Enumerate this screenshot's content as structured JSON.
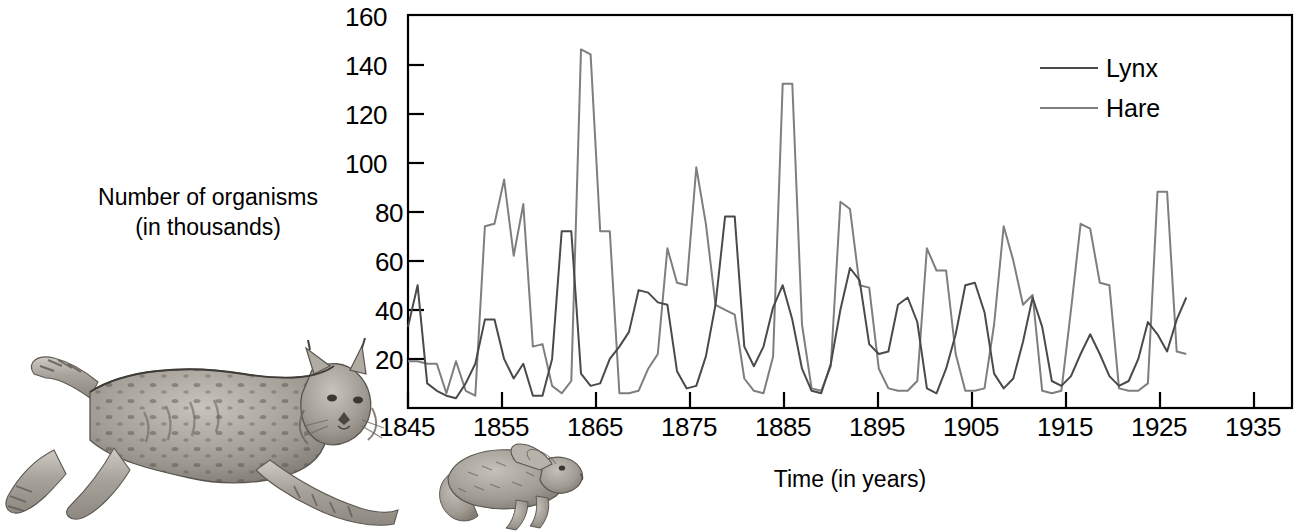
{
  "figure": {
    "title": "",
    "background_color": "#ffffff"
  },
  "axes": {
    "y_label_line1": "Number of organisms",
    "y_label_line2": "(in thousands)",
    "x_label": "Time (in years)",
    "y_ticks": [
      "20",
      "40",
      "60",
      "80",
      "100",
      "120",
      "140",
      "160"
    ],
    "x_ticks": [
      "1845",
      "1855",
      "1865",
      "1875",
      "1885",
      "1895",
      "1905",
      "1915",
      "1925",
      "1935"
    ]
  },
  "legend": {
    "items": [
      {
        "label": "Lynx",
        "color": "#4a4a4a"
      },
      {
        "label": "Hare",
        "color": "#7e7e7e"
      }
    ]
  },
  "illustrations": [
    {
      "name": "lynx-drawing",
      "caption": "Lynx"
    },
    {
      "name": "hare-drawing",
      "caption": "Snowshoe hare"
    }
  ],
  "chart_data": {
    "type": "line",
    "title": "",
    "subtitle": "",
    "xlabel": "Time (in years)",
    "ylabel": "Number of organisms (in thousands)",
    "xlim": [
      1845,
      1937
    ],
    "ylim": [
      0,
      160
    ],
    "y_ticks": [
      20,
      40,
      60,
      80,
      100,
      120,
      140,
      160
    ],
    "x_ticks": [
      1845,
      1855,
      1865,
      1875,
      1885,
      1895,
      1905,
      1915,
      1925,
      1935
    ],
    "grid": false,
    "legend_position": "top-right",
    "x": [
      1845,
      1846,
      1847,
      1848,
      1849,
      1850,
      1851,
      1852,
      1853,
      1854,
      1855,
      1856,
      1857,
      1858,
      1859,
      1860,
      1861,
      1862,
      1863,
      1864,
      1865,
      1866,
      1867,
      1868,
      1869,
      1870,
      1871,
      1872,
      1873,
      1874,
      1875,
      1876,
      1877,
      1878,
      1879,
      1880,
      1881,
      1882,
      1883,
      1884,
      1885,
      1886,
      1887,
      1888,
      1889,
      1890,
      1891,
      1892,
      1893,
      1894,
      1895,
      1896,
      1897,
      1898,
      1899,
      1900,
      1901,
      1902,
      1903,
      1904,
      1905,
      1906,
      1907,
      1908,
      1909,
      1910,
      1911,
      1912,
      1913,
      1914,
      1915,
      1916,
      1917,
      1918,
      1919,
      1920,
      1921,
      1922,
      1923,
      1924,
      1925,
      1926,
      1927,
      1928,
      1929,
      1930,
      1931,
      1932,
      1933,
      1934,
      1935,
      1936,
      1937
    ],
    "series": [
      {
        "name": "Hare",
        "color": "#7e7e7e",
        "values": [
          20,
          20,
          52,
          83,
          64,
          68,
          83,
          12,
          36,
          150,
          110,
          60,
          7,
          10,
          70,
          100,
          92,
          70,
          10,
          11,
          137,
          137,
          18,
          22,
          52,
          83,
          18,
          10,
          9,
          65,
          11,
          82,
          90,
          27,
          20,
          30,
          6,
          45,
          140,
          100,
          15,
          5,
          12,
          15,
          130,
          60,
          55,
          40,
          9,
          9,
          65,
          35,
          75,
          40,
          18,
          20,
          40,
          65,
          80,
          25,
          18,
          30,
          20,
          22,
          80,
          90,
          40,
          15,
          5,
          10,
          55,
          65,
          60,
          20,
          10,
          25,
          40,
          50,
          40,
          30,
          18,
          10,
          15,
          40,
          85,
          60,
          30,
          18,
          10,
          5,
          20,
          65,
          55
        ]
      },
      {
        "name": "Lynx",
        "color": "#4a4a4a",
        "values": [
          35,
          50,
          15,
          5,
          6,
          10,
          20,
          30,
          35,
          20,
          10,
          8,
          6,
          5,
          8,
          30,
          40,
          45,
          60,
          60,
          40,
          30,
          12,
          8,
          8,
          12,
          18,
          25,
          35,
          40,
          20,
          18,
          12,
          8,
          5,
          8,
          12,
          20,
          30,
          45,
          50,
          35,
          20,
          15,
          20,
          30,
          40,
          45,
          30,
          20,
          12,
          10,
          18,
          25,
          35,
          45,
          45,
          35,
          25,
          15,
          10,
          12,
          18,
          25,
          35,
          45,
          40,
          30,
          20,
          12,
          10,
          15,
          20,
          25,
          30,
          35,
          40,
          35,
          25,
          18,
          12,
          10,
          12,
          18,
          25,
          35,
          40,
          35,
          25,
          18,
          12,
          15,
          20
        ]
      }
    ],
    "hare_points": [
      {
        "year": 1845,
        "value": 19
      },
      {
        "year": 1846,
        "value": 19
      },
      {
        "year": 1847,
        "value": 18
      },
      {
        "year": 1848,
        "value": 18
      },
      {
        "year": 1849,
        "value": 6
      },
      {
        "year": 1850,
        "value": 19
      },
      {
        "year": 1851,
        "value": 7
      },
      {
        "year": 1852,
        "value": 5
      },
      {
        "year": 1853,
        "value": 74
      },
      {
        "year": 1854,
        "value": 75
      },
      {
        "year": 1855,
        "value": 93
      },
      {
        "year": 1856,
        "value": 62
      },
      {
        "year": 1857,
        "value": 83
      },
      {
        "year": 1858,
        "value": 25
      },
      {
        "year": 1859,
        "value": 26
      },
      {
        "year": 1860,
        "value": 9
      },
      {
        "year": 1861,
        "value": 6
      },
      {
        "year": 1862,
        "value": 11
      },
      {
        "year": 1863,
        "value": 146
      },
      {
        "year": 1864,
        "value": 144
      },
      {
        "year": 1865,
        "value": 72
      },
      {
        "year": 1866,
        "value": 72
      },
      {
        "year": 1867,
        "value": 6
      },
      {
        "year": 1868,
        "value": 6
      },
      {
        "year": 1869,
        "value": 7
      },
      {
        "year": 1870,
        "value": 16
      },
      {
        "year": 1871,
        "value": 22
      },
      {
        "year": 1872,
        "value": 65
      },
      {
        "year": 1873,
        "value": 51
      },
      {
        "year": 1874,
        "value": 50
      },
      {
        "year": 1875,
        "value": 98
      },
      {
        "year": 1876,
        "value": 75
      },
      {
        "year": 1877,
        "value": 42
      },
      {
        "year": 1878,
        "value": 40
      },
      {
        "year": 1879,
        "value": 38
      },
      {
        "year": 1880,
        "value": 12
      },
      {
        "year": 1881,
        "value": 7
      },
      {
        "year": 1882,
        "value": 6
      },
      {
        "year": 1883,
        "value": 21
      },
      {
        "year": 1884,
        "value": 132
      },
      {
        "year": 1885,
        "value": 132
      },
      {
        "year": 1886,
        "value": 34
      },
      {
        "year": 1887,
        "value": 8
      },
      {
        "year": 1888,
        "value": 7
      },
      {
        "year": 1889,
        "value": 17
      },
      {
        "year": 1890,
        "value": 84
      },
      {
        "year": 1891,
        "value": 81
      },
      {
        "year": 1892,
        "value": 50
      },
      {
        "year": 1893,
        "value": 49
      },
      {
        "year": 1894,
        "value": 16
      },
      {
        "year": 1895,
        "value": 8
      },
      {
        "year": 1896,
        "value": 7
      },
      {
        "year": 1897,
        "value": 7
      },
      {
        "year": 1898,
        "value": 11
      },
      {
        "year": 1899,
        "value": 65
      },
      {
        "year": 1900,
        "value": 56
      },
      {
        "year": 1901,
        "value": 56
      },
      {
        "year": 1902,
        "value": 22
      },
      {
        "year": 1903,
        "value": 7
      },
      {
        "year": 1904,
        "value": 7
      },
      {
        "year": 1905,
        "value": 8
      },
      {
        "year": 1906,
        "value": 34
      },
      {
        "year": 1907,
        "value": 74
      },
      {
        "year": 1908,
        "value": 60
      },
      {
        "year": 1909,
        "value": 42
      },
      {
        "year": 1910,
        "value": 46
      },
      {
        "year": 1911,
        "value": 7
      },
      {
        "year": 1912,
        "value": 6
      },
      {
        "year": 1913,
        "value": 7
      },
      {
        "year": 1914,
        "value": 40
      },
      {
        "year": 1915,
        "value": 75
      },
      {
        "year": 1916,
        "value": 73
      },
      {
        "year": 1917,
        "value": 51
      },
      {
        "year": 1918,
        "value": 50
      },
      {
        "year": 1919,
        "value": 8
      },
      {
        "year": 1920,
        "value": 7
      },
      {
        "year": 1921,
        "value": 7
      },
      {
        "year": 1922,
        "value": 10
      },
      {
        "year": 1923,
        "value": 88
      },
      {
        "year": 1924,
        "value": 88
      },
      {
        "year": 1925,
        "value": 23
      },
      {
        "year": 1926,
        "value": 22
      }
    ],
    "lynx_points": [
      {
        "year": 1845,
        "value": 33
      },
      {
        "year": 1846,
        "value": 50
      },
      {
        "year": 1847,
        "value": 10
      },
      {
        "year": 1848,
        "value": 7
      },
      {
        "year": 1849,
        "value": 5
      },
      {
        "year": 1850,
        "value": 4
      },
      {
        "year": 1851,
        "value": 10
      },
      {
        "year": 1852,
        "value": 18
      },
      {
        "year": 1853,
        "value": 36
      },
      {
        "year": 1854,
        "value": 36
      },
      {
        "year": 1855,
        "value": 20
      },
      {
        "year": 1856,
        "value": 12
      },
      {
        "year": 1857,
        "value": 18
      },
      {
        "year": 1858,
        "value": 5
      },
      {
        "year": 1859,
        "value": 5
      },
      {
        "year": 1860,
        "value": 20
      },
      {
        "year": 1861,
        "value": 72
      },
      {
        "year": 1862,
        "value": 72
      },
      {
        "year": 1863,
        "value": 14
      },
      {
        "year": 1864,
        "value": 9
      },
      {
        "year": 1865,
        "value": 10
      },
      {
        "year": 1866,
        "value": 20
      },
      {
        "year": 1867,
        "value": 25
      },
      {
        "year": 1868,
        "value": 31
      },
      {
        "year": 1869,
        "value": 48
      },
      {
        "year": 1870,
        "value": 47
      },
      {
        "year": 1871,
        "value": 43
      },
      {
        "year": 1872,
        "value": 42
      },
      {
        "year": 1873,
        "value": 15
      },
      {
        "year": 1874,
        "value": 8
      },
      {
        "year": 1875,
        "value": 9
      },
      {
        "year": 1876,
        "value": 21
      },
      {
        "year": 1877,
        "value": 42
      },
      {
        "year": 1878,
        "value": 78
      },
      {
        "year": 1879,
        "value": 78
      },
      {
        "year": 1880,
        "value": 25
      },
      {
        "year": 1881,
        "value": 17
      },
      {
        "year": 1882,
        "value": 25
      },
      {
        "year": 1883,
        "value": 41
      },
      {
        "year": 1884,
        "value": 50
      },
      {
        "year": 1885,
        "value": 36
      },
      {
        "year": 1886,
        "value": 16
      },
      {
        "year": 1887,
        "value": 7
      },
      {
        "year": 1888,
        "value": 6
      },
      {
        "year": 1889,
        "value": 18
      },
      {
        "year": 1890,
        "value": 40
      },
      {
        "year": 1891,
        "value": 57
      },
      {
        "year": 1892,
        "value": 52
      },
      {
        "year": 1893,
        "value": 26
      },
      {
        "year": 1894,
        "value": 22
      },
      {
        "year": 1895,
        "value": 23
      },
      {
        "year": 1896,
        "value": 42
      },
      {
        "year": 1897,
        "value": 45
      },
      {
        "year": 1898,
        "value": 35
      },
      {
        "year": 1899,
        "value": 8
      },
      {
        "year": 1900,
        "value": 6
      },
      {
        "year": 1901,
        "value": 16
      },
      {
        "year": 1902,
        "value": 30
      },
      {
        "year": 1903,
        "value": 50
      },
      {
        "year": 1904,
        "value": 51
      },
      {
        "year": 1905,
        "value": 39
      },
      {
        "year": 1906,
        "value": 14
      },
      {
        "year": 1907,
        "value": 8
      },
      {
        "year": 1908,
        "value": 12
      },
      {
        "year": 1909,
        "value": 27
      },
      {
        "year": 1910,
        "value": 45
      },
      {
        "year": 1911,
        "value": 33
      },
      {
        "year": 1912,
        "value": 11
      },
      {
        "year": 1913,
        "value": 9
      },
      {
        "year": 1914,
        "value": 13
      },
      {
        "year": 1915,
        "value": 22
      },
      {
        "year": 1916,
        "value": 30
      },
      {
        "year": 1917,
        "value": 22
      },
      {
        "year": 1918,
        "value": 13
      },
      {
        "year": 1919,
        "value": 9
      },
      {
        "year": 1920,
        "value": 11
      },
      {
        "year": 1921,
        "value": 20
      },
      {
        "year": 1922,
        "value": 35
      },
      {
        "year": 1923,
        "value": 30
      },
      {
        "year": 1924,
        "value": 23
      },
      {
        "year": 1925,
        "value": 36
      },
      {
        "year": 1926,
        "value": 45
      }
    ]
  }
}
